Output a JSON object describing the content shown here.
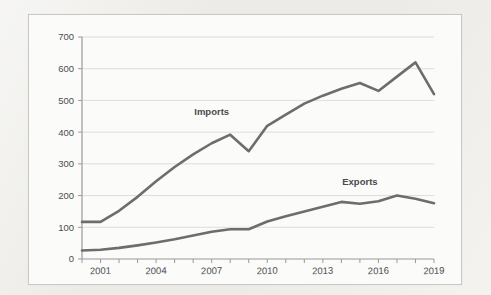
{
  "figure": {
    "background_color": "#ecebe7",
    "panel_color": "#fbfbfa",
    "panel_border_color": "#c9c8c4",
    "line_color": "#6d6d6d",
    "grid_color": "#d6d5d2",
    "axis_color": "#9a9a97"
  },
  "chart_data": {
    "type": "line",
    "title": "",
    "subtitle": "",
    "xlabel": "",
    "ylabel": "",
    "xlim": [
      2000,
      2019
    ],
    "ylim": [
      0,
      700
    ],
    "grid": "horizontal",
    "legend_position": "inline-annotation",
    "y_ticks": [
      0,
      100,
      200,
      300,
      400,
      500,
      600,
      700
    ],
    "y_tick_labels": [
      "0",
      "100",
      "200",
      "300",
      "400",
      "500",
      "600",
      "700"
    ],
    "x_ticks": [
      2000,
      2001,
      2002,
      2003,
      2004,
      2005,
      2006,
      2007,
      2008,
      2009,
      2010,
      2011,
      2012,
      2013,
      2014,
      2015,
      2016,
      2017,
      2018,
      2019
    ],
    "x_tick_labels_shown": [
      "2001",
      "2004",
      "2007",
      "2010",
      "2013",
      "2016",
      "2019"
    ],
    "x_labeled_years": [
      2001,
      2004,
      2007,
      2010,
      2013,
      2016,
      2019
    ],
    "x": [
      2000,
      2001,
      2002,
      2003,
      2004,
      2005,
      2006,
      2007,
      2008,
      2009,
      2010,
      2011,
      2012,
      2013,
      2014,
      2015,
      2016,
      2017,
      2018,
      2019
    ],
    "series": [
      {
        "name": "Imports",
        "label_x": 2007,
        "label_y": 455,
        "values": [
          117,
          117,
          152,
          196,
          245,
          290,
          330,
          365,
          392,
          340,
          420,
          455,
          490,
          515,
          537,
          555,
          530,
          575,
          620,
          520
        ]
      },
      {
        "name": "Exports",
        "label_x": 2015,
        "label_y": 232,
        "values": [
          27,
          29,
          35,
          43,
          52,
          62,
          74,
          86,
          94,
          94,
          118,
          135,
          150,
          165,
          180,
          174,
          182,
          200,
          190,
          176
        ]
      }
    ],
    "annotations": [
      {
        "text": "Imports",
        "x": 2007,
        "y": 455
      },
      {
        "text": "Exports",
        "x": 2015,
        "y": 232
      }
    ]
  }
}
